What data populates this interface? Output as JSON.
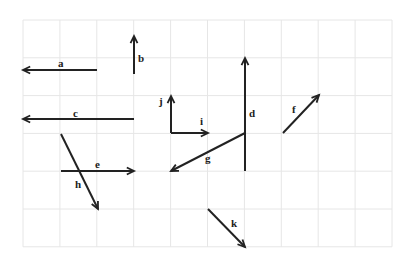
{
  "grid": {
    "x0": 23,
    "y0": 20,
    "cols": 10,
    "rows": 6,
    "cell_w": 36.9,
    "cell_h": 37.8,
    "line_color": "#e6e6e6"
  },
  "vector_color": "#222222",
  "vectors": [
    {
      "name": "a",
      "x1": 97,
      "y1": 70,
      "x2": 23,
      "y2": 70,
      "lx": 58,
      "ly": 67
    },
    {
      "name": "b",
      "x1": 134,
      "y1": 74,
      "x2": 134,
      "y2": 36,
      "lx": 138,
      "ly": 62
    },
    {
      "name": "c",
      "x1": 134,
      "y1": 119,
      "x2": 23,
      "y2": 119,
      "lx": 73,
      "ly": 117
    },
    {
      "name": "d",
      "x1": 245,
      "y1": 171,
      "x2": 245,
      "y2": 58,
      "lx": 249,
      "ly": 117
    },
    {
      "name": "e",
      "x1": 61,
      "y1": 171,
      "x2": 134,
      "y2": 171,
      "lx": 95,
      "ly": 168
    },
    {
      "name": "f",
      "x1": 283,
      "y1": 133,
      "x2": 319,
      "y2": 95,
      "lx": 292,
      "ly": 113
    },
    {
      "name": "g",
      "x1": 245,
      "y1": 133,
      "x2": 171,
      "y2": 171,
      "lx": 205,
      "ly": 162
    },
    {
      "name": "h",
      "x1": 61,
      "y1": 134,
      "x2": 98,
      "y2": 209,
      "lx": 75,
      "ly": 188
    },
    {
      "name": "i",
      "x1": 171,
      "y1": 133,
      "x2": 208,
      "y2": 133,
      "lx": 200,
      "ly": 125
    },
    {
      "name": "j",
      "x1": 171,
      "y1": 133,
      "x2": 171,
      "y2": 96,
      "lx": 159,
      "ly": 105
    },
    {
      "name": "k",
      "x1": 208,
      "y1": 209,
      "x2": 245,
      "y2": 247,
      "lx": 231,
      "ly": 227
    }
  ]
}
